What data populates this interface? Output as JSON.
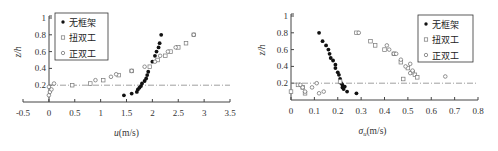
{
  "chart_data": [
    {
      "type": "scatter",
      "title": "",
      "xlabel": "u(m/s)",
      "ylabel": "z/h",
      "xlim": [
        -0.5,
        3.5
      ],
      "ylim": [
        0,
        1
      ],
      "xticks": [
        "-0.5",
        "0",
        "0.5",
        "1",
        "1.5",
        "2",
        "2.5",
        "3",
        "3.5"
      ],
      "yticks": [
        "0.2",
        "0.4",
        "0.6",
        "0.8",
        "1"
      ],
      "grid": false,
      "legend_position": "upper left",
      "reference_line": {
        "y": 0.2,
        "style": "dash-dot"
      },
      "series": [
        {
          "name": "无框架",
          "marker": "filled-circle",
          "x": [
            1.45,
            1.6,
            1.7,
            1.72,
            1.75,
            1.78,
            1.8,
            1.85,
            1.88,
            1.9,
            1.92,
            2.0,
            2.05,
            2.08,
            2.12,
            2.14,
            2.17
          ],
          "y": [
            0.08,
            0.1,
            0.12,
            0.15,
            0.17,
            0.19,
            0.22,
            0.25,
            0.28,
            0.32,
            0.36,
            0.48,
            0.55,
            0.6,
            0.65,
            0.7,
            0.8
          ]
        },
        {
          "name": "扭双工",
          "marker": "open-square",
          "x": [
            0.45,
            0.8,
            1.05,
            1.35,
            1.6,
            1.95,
            2.1,
            2.25,
            2.35,
            2.5,
            2.65,
            2.8
          ],
          "y": [
            0.2,
            0.22,
            0.26,
            0.32,
            0.37,
            0.42,
            0.5,
            0.55,
            0.6,
            0.65,
            0.7,
            0.8
          ]
        },
        {
          "name": "正双工",
          "marker": "open-circle",
          "x": [
            0.0,
            0.02,
            0.05,
            0.0,
            0.1,
            0.9,
            1.2,
            1.3,
            1.6,
            1.85,
            2.05,
            2.15,
            2.3,
            2.45,
            2.8
          ],
          "y": [
            0.08,
            0.12,
            0.15,
            0.18,
            0.22,
            0.26,
            0.3,
            0.33,
            0.37,
            0.42,
            0.48,
            0.55,
            0.6,
            0.65,
            0.8
          ]
        }
      ]
    },
    {
      "type": "scatter",
      "title": "",
      "xlabel": "σu(m/s)",
      "ylabel": "z/h",
      "xlim": [
        0,
        0.8
      ],
      "ylim": [
        0,
        1
      ],
      "xticks": [
        "0",
        "0.1",
        "0.2",
        "0.3",
        "0.4",
        "0.5",
        "0.6",
        "0.7",
        "0.8"
      ],
      "yticks": [
        "0.2",
        "0.4",
        "0.6",
        "0.8",
        "1"
      ],
      "grid": false,
      "legend_position": "upper right",
      "reference_line": {
        "y": 0.2,
        "style": "dash-dot"
      },
      "series": [
        {
          "name": "无框架",
          "marker": "filled-circle",
          "x": [
            0.12,
            0.135,
            0.15,
            0.16,
            0.165,
            0.17,
            0.18,
            0.19,
            0.19,
            0.2,
            0.205,
            0.21,
            0.215,
            0.22,
            0.22,
            0.225,
            0.23,
            0.24,
            0.28
          ],
          "y": [
            0.8,
            0.7,
            0.65,
            0.6,
            0.55,
            0.5,
            0.47,
            0.42,
            0.38,
            0.33,
            0.3,
            0.25,
            0.2,
            0.18,
            0.15,
            0.13,
            0.16,
            0.1,
            0.08
          ]
        },
        {
          "name": "扭双工",
          "marker": "open-square",
          "x": [
            0.0,
            0.03,
            0.05,
            0.06,
            0.21,
            0.28,
            0.34,
            0.36,
            0.4,
            0.44,
            0.47,
            0.48,
            0.5,
            0.52,
            0.53,
            0.54
          ],
          "y": [
            0.1,
            0.18,
            0.15,
            0.08,
            0.22,
            0.8,
            0.7,
            0.65,
            0.6,
            0.55,
            0.45,
            0.25,
            0.38,
            0.33,
            0.3,
            0.27
          ],
          "note": "approximate"
        },
        {
          "name": "正双工",
          "marker": "open-circle",
          "x": [
            0.04,
            0.05,
            0.06,
            0.09,
            0.11,
            0.12,
            0.14,
            0.29,
            0.41,
            0.42,
            0.44,
            0.45,
            0.47,
            0.49,
            0.51,
            0.51,
            0.52,
            0.66
          ],
          "y": [
            0.18,
            0.15,
            0.1,
            0.15,
            0.2,
            0.08,
            0.1,
            0.8,
            0.65,
            0.6,
            0.55,
            0.55,
            0.48,
            0.4,
            0.43,
            0.32,
            0.35,
            0.28
          ]
        }
      ]
    }
  ],
  "left": {
    "ylabel": "z/h",
    "xlabel_main": "u",
    "xlabel_unit": "(m/s)",
    "legend": [
      "无框架",
      "扭双工",
      "正双工"
    ]
  },
  "right": {
    "ylabel": "z/h",
    "xlabel_main": "σ",
    "xlabel_sub": "u",
    "xlabel_unit": "(m/s)",
    "legend": [
      "无框架",
      "扭双工",
      "正双工"
    ]
  }
}
